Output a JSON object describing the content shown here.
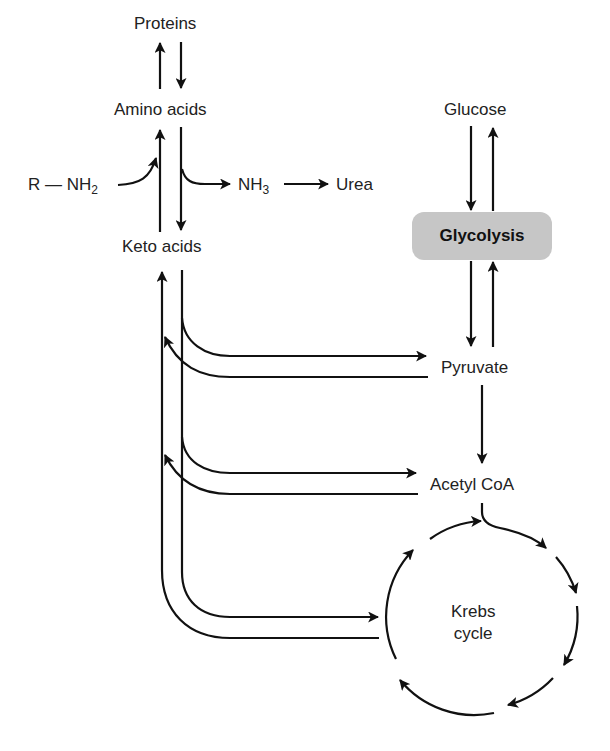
{
  "diagram": {
    "nodes": {
      "proteins": "Proteins",
      "amino_acids": "Amino acids",
      "r_nh2_prefix": "R — NH",
      "r_nh2_sub": "2",
      "nh3_prefix": "NH",
      "nh3_sub": "3",
      "urea": "Urea",
      "keto_acids": "Keto acids",
      "glucose": "Glucose",
      "glycolysis": "Glycolysis",
      "pyruvate": "Pyruvate",
      "acetyl_coa": "Acetyl CoA",
      "krebs_line1": "Krebs",
      "krebs_line2": "cycle"
    },
    "edges": [
      {
        "from": "Amino acids",
        "to": "Proteins"
      },
      {
        "from": "Proteins",
        "to": "Amino acids"
      },
      {
        "from": "R—NH2",
        "to": "Amino acids"
      },
      {
        "from": "Amino acids",
        "to": "NH3"
      },
      {
        "from": "NH3",
        "to": "Urea"
      },
      {
        "from": "Amino acids",
        "to": "Keto acids"
      },
      {
        "from": "Keto acids",
        "to": "Amino acids"
      },
      {
        "from": "Glucose",
        "to": "Glycolysis"
      },
      {
        "from": "Glycolysis",
        "to": "Glucose"
      },
      {
        "from": "Glycolysis",
        "to": "Pyruvate"
      },
      {
        "from": "Pyruvate",
        "to": "Glycolysis"
      },
      {
        "from": "Keto acids",
        "to": "Pyruvate"
      },
      {
        "from": "Pyruvate",
        "to": "Keto acids"
      },
      {
        "from": "Pyruvate",
        "to": "Acetyl CoA"
      },
      {
        "from": "Keto acids",
        "to": "Acetyl CoA"
      },
      {
        "from": "Acetyl CoA",
        "to": "Keto acids"
      },
      {
        "from": "Acetyl CoA",
        "to": "Krebs cycle"
      },
      {
        "from": "Keto acids",
        "to": "Krebs cycle"
      },
      {
        "from": "Krebs cycle",
        "to": "Keto acids"
      }
    ],
    "colors": {
      "line": "#111111",
      "text": "#222222",
      "glycolysis_fill": "#c6c6c6",
      "background": "#ffffff"
    }
  }
}
